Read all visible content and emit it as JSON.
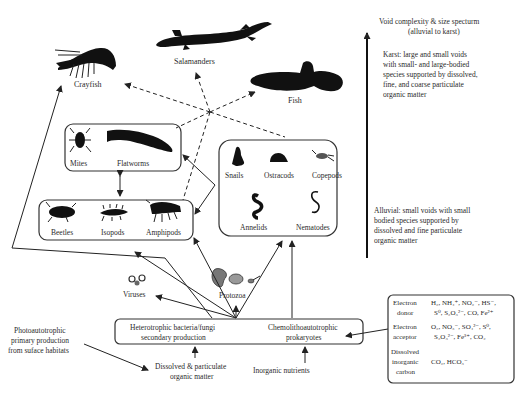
{
  "diagram": {
    "top_organisms": {
      "crayfish": "Crayfish",
      "salamanders": "Salamanders",
      "fish": "Fish"
    },
    "box_mites_flatworms": {
      "mites": "Mites",
      "flatworms": "Flatworms"
    },
    "box_beetles": {
      "beetles": "Beetles",
      "isopods": "Isopods",
      "amphipods": "Amphipods"
    },
    "box_snails": {
      "snails": "Snails",
      "ostracods": "Ostracods",
      "copepods": "Copepods",
      "annelids": "Annelids",
      "nematodes": "Nematodes"
    },
    "microbes": {
      "viruses": "Viruses",
      "protozoa": "Protozoa"
    },
    "production_box": {
      "hetero_line1": "Heterotrophic bacteria/fungi",
      "hetero_line2": "secondary production",
      "chemo_line1": "Chemolithoautotrophic",
      "chemo_line2": "prokaryotes"
    },
    "inputs": {
      "dom_line1": "Dissolved & particulate",
      "dom_line2": "organic matter",
      "inorganic": "Inorganic nutrients",
      "photo_line1": "Photoautotrophic",
      "photo_line2": "primary production",
      "photo_line3": "from suface habitats"
    },
    "spectrum": {
      "title_line1": "Void complexity & size specturm",
      "title_line2": "(alluvial to karst)",
      "karst": [
        "Karst: large and small voids",
        "with small- and large-bodied",
        "species supported by dissolved,",
        "fine, and coarse particulate",
        "organic matter"
      ],
      "alluvial": [
        "Alluvial: small voids with small",
        "bodied species supported by",
        "dissolved and fine particulate",
        "organic matter"
      ]
    },
    "chem_table": {
      "rows": [
        {
          "label": [
            "Electron",
            "donor"
          ],
          "value": [
            "H₂, NH₄⁺, NO₂⁻, HS⁻,",
            "S⁰, S₂O₃²⁻, CO, Fe²⁺"
          ]
        },
        {
          "label": [
            "Electron",
            "acceptor"
          ],
          "value": [
            "O₂, NO₃⁻, SO₄²⁻, S⁰,",
            "S₂O₃²⁻, Fe³⁺, CO₂"
          ]
        },
        {
          "label": [
            "Dissolved",
            "inorganic",
            "carbon"
          ],
          "value": [
            "CO₂, HCO₃⁻"
          ]
        }
      ]
    }
  }
}
